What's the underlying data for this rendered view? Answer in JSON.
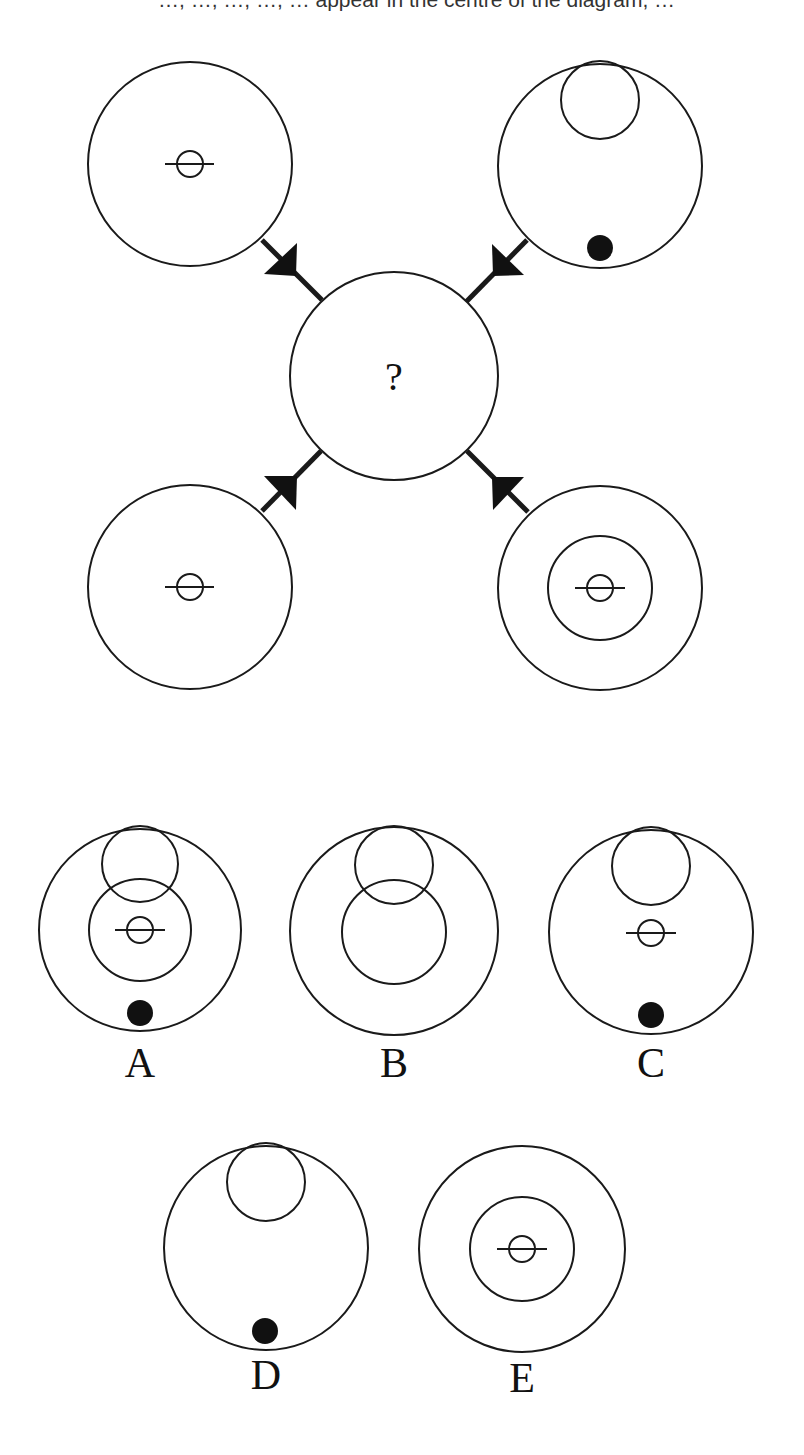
{
  "instruction": {
    "visible_fragment": "…, …, …, …, … appear in the centre of the diagram, …"
  },
  "puzzle": {
    "center_label": "?",
    "stroke_color": "#1a1a1a",
    "fill_color": "#111111",
    "background": "#ffffff",
    "source_circles": [
      {
        "position": "top-left",
        "elements": [
          "crossed-small-circle"
        ]
      },
      {
        "position": "top-right",
        "elements": [
          "top-inner-circle",
          "bottom-dot"
        ]
      },
      {
        "position": "bottom-left",
        "elements": [
          "crossed-small-circle"
        ]
      },
      {
        "position": "bottom-right",
        "elements": [
          "middle-ring",
          "crossed-small-circle"
        ]
      }
    ]
  },
  "options": [
    {
      "label": "A",
      "elements": [
        "top-inner-circle",
        "middle-ring",
        "crossed-small-circle",
        "bottom-dot"
      ]
    },
    {
      "label": "B",
      "elements": [
        "top-inner-circle",
        "middle-ring"
      ]
    },
    {
      "label": "C",
      "elements": [
        "top-inner-circle",
        "crossed-small-circle",
        "bottom-dot"
      ]
    },
    {
      "label": "D",
      "elements": [
        "top-inner-circle",
        "bottom-dot"
      ]
    },
    {
      "label": "E",
      "elements": [
        "middle-ring",
        "crossed-small-circle"
      ]
    }
  ]
}
